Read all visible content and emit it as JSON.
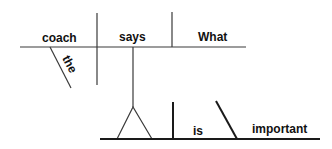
{
  "diagram": {
    "type": "Reed-Kellogg sentence diagram",
    "sentence_words": {
      "subject": "coach",
      "subject_modifier": "the",
      "verb": "says",
      "direct_object": "What",
      "clause_verb": "is",
      "predicate_adjective": "important"
    },
    "colors": {
      "line": "#3a3a3a",
      "text": "#111111",
      "background": "#ffffff"
    }
  }
}
